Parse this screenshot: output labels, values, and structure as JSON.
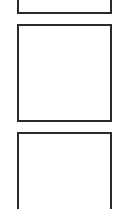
{
  "panels": [
    {
      "id": "panel-1",
      "label": "",
      "border_color": "#2a2a2a"
    },
    {
      "id": "panel-2",
      "label": "",
      "border_color": "#2a2a2a"
    },
    {
      "id": "panel-3",
      "label": "",
      "border_color": "#2a2a2a"
    }
  ]
}
